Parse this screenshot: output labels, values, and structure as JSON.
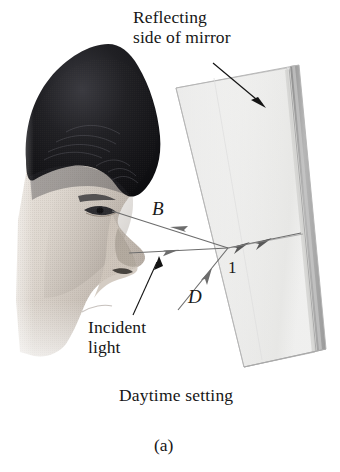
{
  "figure": {
    "caption": "(a)",
    "subcaption": "Daytime setting",
    "annotations": {
      "reflecting_side": "Reflecting\nside of mirror",
      "incident_light": "Incident\nlight",
      "ray_b": "B",
      "ray_d": "D",
      "surface_one": "1"
    },
    "colors": {
      "background": "#ffffff",
      "ink": "#161616",
      "ray_line": "#6b6b6b",
      "mirror_glass": "#f4f4f4",
      "mirror_outline": "#b4b4b4",
      "mirror_coating": "#a9a9a9",
      "hair_dark": "#17171a",
      "skin_light": "#d8d2cc"
    },
    "elements": {
      "photo": "profile-photo-of-person",
      "mirror": "wedge-mirror",
      "reflecting_strip": "silvered-back-surface",
      "pointer_arrow": "reflecting-side-pointer",
      "incident_pointer": "incident-light-pointer"
    }
  }
}
